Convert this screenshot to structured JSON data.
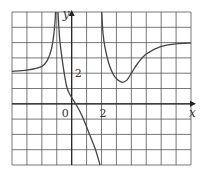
{
  "chart_data": {
    "type": "line",
    "title": "",
    "xlabel": "x",
    "ylabel": "y",
    "xlim": [
      -4,
      8
    ],
    "ylim": [
      -4,
      6
    ],
    "grid": true,
    "grid_step": 1,
    "tick_labels": {
      "origin": "0",
      "x": [
        {
          "value": 2,
          "label": "2"
        }
      ],
      "y": [
        {
          "value": 2,
          "label": "2"
        }
      ]
    },
    "asymptotes": {
      "vertical": [
        -1,
        2
      ],
      "horizontal_left": 2,
      "horizontal_right": 4
    },
    "series": [
      {
        "name": "left-branch",
        "x": [
          -4,
          -3,
          -2,
          -1.6,
          -1.35,
          -1.2,
          -1.12,
          -1.08
        ],
        "y": [
          2.12,
          2.2,
          2.45,
          2.9,
          3.6,
          4.5,
          5.3,
          6
        ]
      },
      {
        "name": "middle-branch",
        "x": [
          -0.92,
          -0.8,
          -0.65,
          -0.5,
          -0.3,
          0,
          0.3,
          0.7,
          1.2,
          1.6,
          1.9
        ],
        "y": [
          6,
          4.2,
          3,
          2,
          1,
          0.4,
          -0.05,
          -0.8,
          -2,
          -3,
          -4
        ]
      },
      {
        "name": "right-branch",
        "x": [
          2.02,
          2.1,
          2.25,
          2.5,
          2.8,
          3.1,
          3.4,
          3.7,
          4.0,
          4.4,
          5,
          6,
          7,
          8
        ],
        "y": [
          6,
          4.6,
          3.6,
          2.6,
          1.9,
          1.55,
          1.4,
          1.55,
          2.0,
          2.6,
          3.25,
          3.75,
          3.92,
          3.97
        ]
      }
    ],
    "min_point": {
      "x": 3.4,
      "y": 1.4
    }
  },
  "colors": {
    "grid": "#555555",
    "curve": "#444444",
    "axis": "#222222",
    "background": "#ffffff"
  }
}
